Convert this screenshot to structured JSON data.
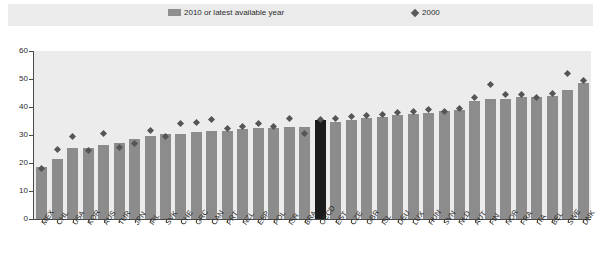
{
  "legend": {
    "bars_label": "2010 or latest available year",
    "diamond_label": "2000",
    "bar_icon": "bar-swatch-icon",
    "diamond_icon": "diamond-marker-icon"
  },
  "axis": {
    "y_ticks": [
      "0",
      "10",
      "20",
      "30",
      "40",
      "50",
      "60"
    ]
  },
  "chart_data": {
    "type": "bar",
    "title": "",
    "subtitle": "",
    "xlabel": "",
    "ylabel": "",
    "ylim": [
      0,
      60
    ],
    "grid": false,
    "legend_position": "top",
    "categories": [
      "MEX",
      "CHL",
      "USA",
      "KOR",
      "AUS",
      "TUR",
      "JPN",
      "IRL",
      "SVK",
      "CHE",
      "GRC",
      "CAN",
      "PRT",
      "NZL",
      "ESP",
      "POL",
      "ISR",
      "BRA",
      "OECD",
      "EST",
      "CZE",
      "GBR",
      "ISL",
      "DEU",
      "LUX",
      "HUN",
      "SVN",
      "NLD",
      "AUT",
      "FIN",
      "NOR",
      "FRA",
      "ITA",
      "BEL",
      "SWE",
      "DNK"
    ],
    "highlight_category": "OECD",
    "highlight_color": "#1b1b1b",
    "bar_color": "#8c8c8c",
    "marker_color": "#555555",
    "series": [
      {
        "name": "2010 or latest available year",
        "type": "bar",
        "values": [
          18.5,
          21.5,
          25.5,
          25.5,
          26.5,
          27.0,
          28.5,
          29.5,
          30.5,
          30.5,
          31.0,
          31.5,
          31.5,
          32.0,
          32.5,
          32.5,
          33.0,
          33.0,
          35.5,
          34.5,
          35.5,
          36.0,
          36.5,
          37.0,
          37.5,
          38.0,
          38.5,
          39.0,
          42.0,
          43.0,
          43.0,
          43.5,
          43.5,
          44.0,
          46.0,
          48.5
        ]
      },
      {
        "name": "2000",
        "type": "scatter",
        "values": [
          18.0,
          25.0,
          29.5,
          24.5,
          30.5,
          25.5,
          27.0,
          31.5,
          29.5,
          34.0,
          34.5,
          35.5,
          32.5,
          33.0,
          34.0,
          33.0,
          36.0,
          30.5,
          35.5,
          36.0,
          36.5,
          37.0,
          37.5,
          38.0,
          38.5,
          39.0,
          38.5,
          39.5,
          43.5,
          48.0,
          44.5,
          44.5,
          43.5,
          45.0,
          52.0,
          49.5
        ]
      }
    ]
  }
}
